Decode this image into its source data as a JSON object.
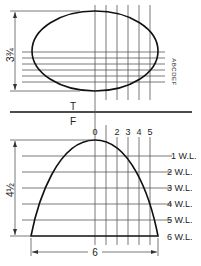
{
  "top_view": {
    "height_dim_label": "3¾",
    "section_labels_rotated": "ABCDEF",
    "view_label": "T"
  },
  "front_view": {
    "view_label": "F",
    "station_labels": [
      "0",
      "1",
      "2",
      "3",
      "4",
      "5"
    ],
    "height_dim_label": "4½",
    "width_dim_label": "6",
    "waterlines": [
      "1 W.L.",
      "2 W.L.",
      "3 W.L.",
      "4 W.L.",
      "5 W.L.",
      "6 W.L."
    ]
  }
}
